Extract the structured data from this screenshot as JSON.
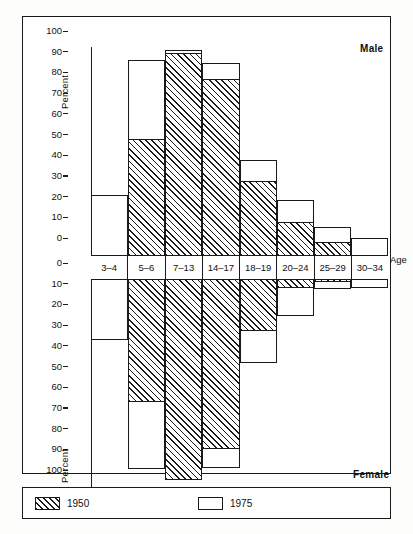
{
  "figure": {
    "male_label": "Male",
    "female_label": "Female",
    "y_axis_title_top": "Percent",
    "y_axis_title_bottom": "Percent",
    "x_axis_title": "Age",
    "background": "#ffffff",
    "ink": "#1a1a1a"
  },
  "legend": {
    "position": "bottom",
    "items": [
      {
        "label": "1950",
        "pattern": "hatched"
      },
      {
        "label": "1975",
        "pattern": "outline"
      }
    ]
  },
  "axis": {
    "top_ticks": [
      "100",
      "90",
      "80",
      "70",
      "60",
      "50",
      "40",
      "30",
      "20",
      "10",
      "0"
    ],
    "bottom_ticks": [
      "0",
      "10",
      "20",
      "30",
      "40",
      "50",
      "60",
      "70",
      "80",
      "90",
      "100"
    ]
  },
  "chart_data": {
    "type": "bar",
    "title": "",
    "subtitle": "",
    "xlabel": "Age",
    "ylabel": "Percent",
    "ylim": [
      0,
      100
    ],
    "grid": false,
    "legend_position": "bottom",
    "orientation": "population-pyramid-vertical",
    "categories": [
      "3–4",
      "5–6",
      "7–13",
      "14–17",
      "18–19",
      "20–24",
      "25–29",
      "30–34"
    ],
    "panels": [
      {
        "name": "Male",
        "direction": "up",
        "series": [
          {
            "name": "1950",
            "values": [
              0,
              55.5,
              97,
              84.5,
              35.5,
              15.5,
              6,
              0
            ]
          },
          {
            "name": "1975",
            "values": [
              28.5,
              93.5,
              98.5,
              92.5,
              45.5,
              26,
              13,
              7.5
            ]
          }
        ]
      },
      {
        "name": "Female",
        "direction": "down",
        "series": [
          {
            "name": "1950",
            "values": [
              0,
              58.5,
              96.5,
              81.5,
              24.5,
              3.5,
              0.5,
              0
            ]
          },
          {
            "name": "1975",
            "values": [
              28.5,
              91,
              95,
              90.5,
              40,
              17,
              4,
              3.5
            ]
          }
        ]
      }
    ],
    "annotations": [
      "Male",
      "Female",
      "Age"
    ]
  }
}
